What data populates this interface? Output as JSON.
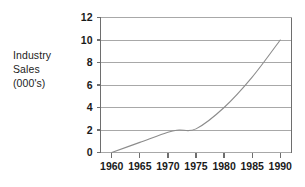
{
  "chart_data": {
    "type": "line",
    "title": "",
    "xlabel": "",
    "ylabel": "Industry Sales (000's)",
    "ylabel_lines": [
      "Industry",
      "Sales",
      "(000's)"
    ],
    "x": [
      1960,
      1965,
      1970,
      1972,
      1975,
      1980,
      1985,
      1990
    ],
    "values": [
      0,
      0.9,
      1.8,
      2.0,
      2.1,
      4.0,
      6.7,
      10.0
    ],
    "series": [
      {
        "name": "Industry Sales",
        "values": [
          0,
          0.9,
          1.8,
          2.0,
          2.1,
          4.0,
          6.7,
          10.0
        ]
      }
    ],
    "x_tick_labels": [
      "1960",
      "1965",
      "1970",
      "1975",
      "1980",
      "1985",
      "1990"
    ],
    "x_tick_values": [
      1960,
      1965,
      1970,
      1975,
      1980,
      1985,
      1990
    ],
    "y_tick_labels": [
      "0",
      "2",
      "4",
      "6",
      "8",
      "10",
      "12"
    ],
    "y_tick_values": [
      0,
      2,
      4,
      6,
      8,
      10,
      12
    ],
    "xlim": [
      1958,
      1992
    ],
    "ylim": [
      0,
      12
    ],
    "grid": true,
    "grid_axis": "y",
    "legend": false,
    "legend_position": "none",
    "colors": {
      "line": "#8c8c8c",
      "grid": "#a8a8a8",
      "axis": "#6e6e6e",
      "text": "#1a1a1a",
      "background": "#ffffff"
    }
  }
}
